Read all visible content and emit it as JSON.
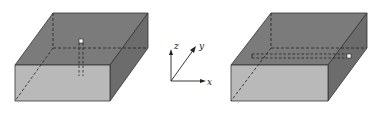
{
  "figure": {
    "left_box": {
      "description": "Rectangular slab with vertical dashed channel through center",
      "colors": {
        "top": "#7a7a7a",
        "side": "#6a6a6a",
        "front": "#b9b9b9",
        "edge": "#333333"
      }
    },
    "axes": {
      "labels": {
        "x": "x",
        "y": "y",
        "z": "z"
      }
    },
    "right_box": {
      "description": "Rectangular slab with horizontal dashed channel parallel to x-axis",
      "colors": {
        "top": "#7a7a7a",
        "side": "#6a6a6a",
        "front": "#b9b9b9",
        "edge": "#333333"
      }
    }
  }
}
